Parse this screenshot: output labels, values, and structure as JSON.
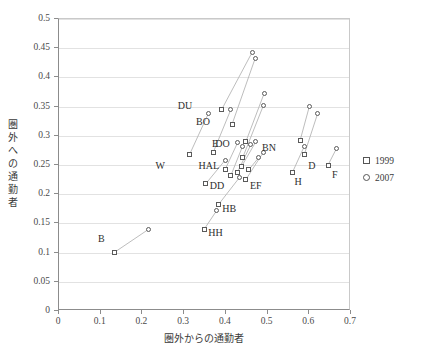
{
  "chart_data": {
    "type": "scatter",
    "title": "",
    "xlabel": "圏外からの通勤者",
    "ylabel": "圏外への通勤者",
    "xlim": [
      0,
      0.7
    ],
    "ylim": [
      0,
      0.5
    ],
    "xticks": [
      "0",
      "0.1",
      "0.2",
      "0.3",
      "0.4",
      "0.5",
      "0.6",
      "0.7"
    ],
    "yticks": [
      "0",
      "0.05",
      "0.1",
      "0.15",
      "0.2",
      "0.25",
      "0.3",
      "0.35",
      "0.4",
      "0.45",
      "0.5"
    ],
    "xtick_values": [
      0,
      0.1,
      0.2,
      0.3,
      0.4,
      0.5,
      0.6,
      0.7
    ],
    "ytick_values": [
      0,
      0.05,
      0.1,
      0.15,
      0.2,
      0.25,
      0.3,
      0.35,
      0.4,
      0.45,
      0.5
    ],
    "grid": "horizontal",
    "legend_position": "right",
    "series": [
      {
        "name": "1999",
        "marker": "square",
        "color": "#5a5a5a"
      },
      {
        "name": "2007",
        "marker": "circle",
        "color": "#5a5a5a"
      }
    ],
    "points": [
      {
        "label": "DU",
        "x1999": 0.39,
        "y1999": 0.345,
        "x2007": 0.463,
        "y2007": 0.443,
        "label_dx": -44,
        "label_dy": -4
      },
      {
        "label": "BO",
        "x1999": 0.415,
        "y1999": 0.32,
        "x2007": 0.47,
        "y2007": 0.432,
        "label_dx": -36,
        "label_dy": -2
      },
      {
        "label": "E",
        "x1999": 0.448,
        "y1999": 0.29,
        "x2007": 0.492,
        "y2007": 0.373,
        "label_dx": -34,
        "label_dy": 2
      },
      {
        "label": "DO",
        "x1999": 0.37,
        "y1999": 0.272,
        "x2007": 0.412,
        "y2007": 0.345,
        "label_dx": 2,
        "label_dy": -8
      },
      {
        "label": "W",
        "x1999": 0.313,
        "y1999": 0.268,
        "x2007": 0.358,
        "y2007": 0.338,
        "label_dx": -34,
        "label_dy": 12
      },
      {
        "label": "HAL",
        "x1999": 0.44,
        "y1999": 0.262,
        "x2007": 0.49,
        "y2007": 0.352,
        "label_dx": -44,
        "label_dy": 8
      },
      {
        "label": "BN",
        "x1999": 0.578,
        "y1999": 0.292,
        "x2007": 0.6,
        "y2007": 0.35,
        "label_dx": -38,
        "label_dy": 8
      },
      {
        "label": "D",
        "x1999": 0.588,
        "y1999": 0.268,
        "x2007": 0.62,
        "y2007": 0.338,
        "label_dx": 4,
        "label_dy": 12
      },
      {
        "label": "H",
        "x1999": 0.56,
        "y1999": 0.238,
        "x2007": 0.588,
        "y2007": 0.282,
        "label_dx": 2,
        "label_dy": 10
      },
      {
        "label": "F",
        "x1999": 0.645,
        "y1999": 0.25,
        "x2007": 0.665,
        "y2007": 0.278,
        "label_dx": 4,
        "label_dy": 10
      },
      {
        "label": "DD",
        "x1999": 0.352,
        "y1999": 0.218,
        "x2007": 0.398,
        "y2007": 0.258,
        "label_dx": 4,
        "label_dy": 2
      },
      {
        "label": "EF",
        "x1999": 0.448,
        "y1999": 0.225,
        "x2007": 0.49,
        "y2007": 0.272,
        "label_dx": 4,
        "label_dy": 6
      },
      {
        "label": "HB",
        "x1999": 0.382,
        "y1999": 0.182,
        "x2007": 0.432,
        "y2007": 0.228,
        "label_dx": 4,
        "label_dy": 4
      },
      {
        "label": "HH",
        "x1999": 0.348,
        "y1999": 0.14,
        "x2007": 0.378,
        "y2007": 0.172,
        "label_dx": 4,
        "label_dy": 4
      },
      {
        "label": "B",
        "x1999": 0.132,
        "y1999": 0.1,
        "x2007": 0.215,
        "y2007": 0.14,
        "label_dx": -16,
        "label_dy": -14
      },
      {
        "label": "",
        "x1999": 0.398,
        "y1999": 0.242,
        "x2007": 0.428,
        "y2007": 0.288,
        "label_dx": 0,
        "label_dy": 0
      },
      {
        "label": "",
        "x1999": 0.412,
        "y1999": 0.232,
        "x2007": 0.44,
        "y2007": 0.282,
        "label_dx": 0,
        "label_dy": 0
      },
      {
        "label": "",
        "x1999": 0.428,
        "y1999": 0.238,
        "x2007": 0.46,
        "y2007": 0.285,
        "label_dx": 0,
        "label_dy": 0
      },
      {
        "label": "",
        "x1999": 0.438,
        "y1999": 0.248,
        "x2007": 0.472,
        "y2007": 0.29,
        "label_dx": 0,
        "label_dy": 0
      },
      {
        "label": "",
        "x1999": 0.455,
        "y1999": 0.242,
        "x2007": 0.478,
        "y2007": 0.262,
        "label_dx": 0,
        "label_dy": 0
      }
    ]
  },
  "legend": {
    "items": [
      {
        "label": "1999",
        "marker": "square"
      },
      {
        "label": "2007",
        "marker": "circle"
      }
    ]
  },
  "axes": {
    "x_title": "圏外からの通勤者",
    "y_title_chars": [
      "圏",
      "外",
      "へ",
      "の",
      "通",
      "勤",
      "者"
    ]
  }
}
